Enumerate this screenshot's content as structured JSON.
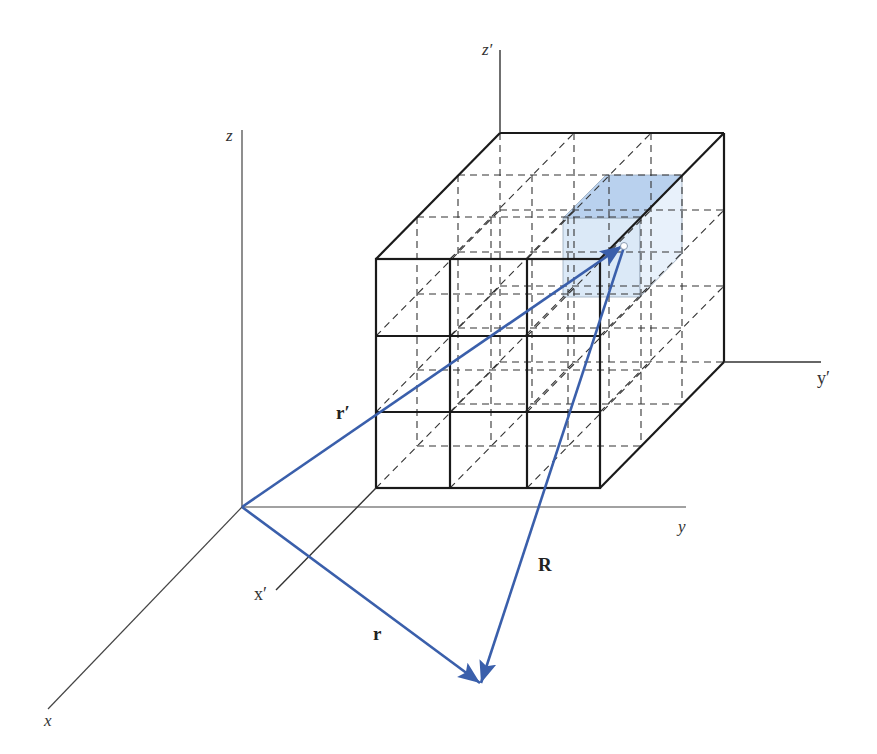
{
  "figure": {
    "colors": {
      "axis": "#333333",
      "cube_edge": "#1a1a1a",
      "dashed": "#333333",
      "vector": "#3a5fab",
      "cell_fill": "#dbe9f7",
      "cell_top_fill": "#b9d1ee"
    },
    "axes": {
      "unprimed": {
        "x_label": "x",
        "y_label": "y",
        "z_label": "z"
      },
      "primed": {
        "x_label": "x′",
        "y_label": "y′",
        "z_label": "z′"
      }
    },
    "vectors": [
      {
        "name": "r",
        "label": "r",
        "from": "origin",
        "to": "field-point"
      },
      {
        "name": "r-prime",
        "label": "r′",
        "from": "origin",
        "to": "source-cell"
      },
      {
        "name": "R",
        "label": "R",
        "from": "source-cell",
        "to": "field-point"
      }
    ],
    "cube": {
      "subdivisions": 3
    }
  }
}
